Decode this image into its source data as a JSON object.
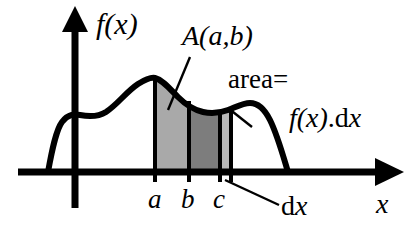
{
  "figure": {
    "kind": "calculus-integral-area-diagram",
    "background_color": "#ffffff",
    "ink_color": "#000000",
    "axes": {
      "y_axis_label": "f(x)",
      "x_axis_label": "x",
      "origin_px": {
        "x": 75,
        "y": 172
      },
      "x_axis_start_px": 18,
      "x_axis_end_px": 400,
      "y_axis_top_px": 10
    },
    "labels": {
      "area_function": "A(a,b)",
      "area_equals": "area=",
      "integrand_expression": "f(x).dx",
      "integrand_parts": {
        "f_of_x": "f(x)",
        "dot": ".",
        "d": "d",
        "x": "x"
      },
      "differential": "dx",
      "differential_parts": {
        "d": "d",
        "x": "x"
      },
      "tick_a": "a",
      "tick_b": "b",
      "tick_c": "c"
    },
    "regions": [
      {
        "name": "region-a-to-b",
        "from_tick": "a",
        "to_tick": "b",
        "fill_color": "#a9a9a9",
        "described_by": "A(a,b)"
      },
      {
        "name": "region-b-to-c",
        "from_tick": "b",
        "to_tick": "c",
        "fill_color": "#7d7d7d",
        "described_by": "A(a,b)"
      },
      {
        "name": "region-dx-strip",
        "from_tick": "c",
        "to_tick": "c+dx",
        "fill_color": "#b8b8b8",
        "described_by": "area= f(x).dx"
      }
    ],
    "tick_positions_px": {
      "a": 155,
      "b": 189,
      "c": 220,
      "c_plus_dx": 231
    },
    "curve": {
      "name": "f(x)",
      "stroke_color": "#000000",
      "stroke_width_px": 6,
      "left_foot_px": 48,
      "right_foot_px": 288,
      "peak_px": {
        "x": 155,
        "y": 78
      }
    },
    "leaders": [
      {
        "name": "leader-A-ab",
        "from_label": "A(a,b)",
        "to_region": "region-a-to-b"
      },
      {
        "name": "leader-area",
        "from_label": "area=",
        "to_region": "region-dx-strip"
      },
      {
        "name": "leader-dx",
        "from_label": "dx",
        "to_region": "region-dx-strip"
      }
    ]
  }
}
